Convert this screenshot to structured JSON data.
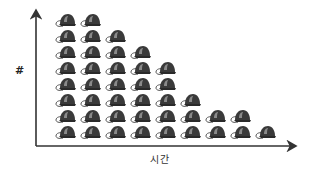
{
  "chart_data": {
    "type": "bar",
    "style": "pictograph",
    "icon": "helmet-icon",
    "title": "",
    "xlabel": "시간",
    "ylabel": "#",
    "categories": [
      "1",
      "2",
      "3",
      "4",
      "5",
      "6",
      "7",
      "8",
      "9"
    ],
    "values": [
      8,
      8,
      7,
      6,
      5,
      3,
      2,
      2,
      1
    ],
    "ylim": [
      0,
      8
    ],
    "grid": false,
    "legend": null,
    "axis_color": "#333333",
    "icon_color": "#3a3a3a"
  }
}
